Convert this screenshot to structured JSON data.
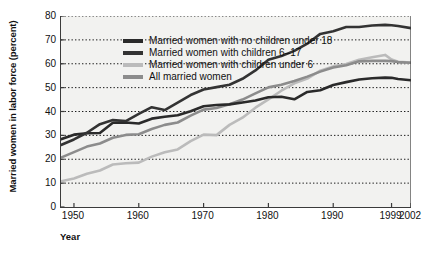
{
  "chart_data": {
    "type": "line",
    "title": "",
    "xlabel": "Year",
    "ylabel": "Married women in labor force (percent)",
    "xlim": [
      1948,
      2002
    ],
    "ylim": [
      0,
      80
    ],
    "xticks": [
      "1950",
      "1960",
      "1970",
      "1980",
      "1990",
      "1999",
      "2002"
    ],
    "xtick_values": [
      1950,
      1960,
      1970,
      1980,
      1990,
      1999,
      2002
    ],
    "yticks": [
      "0",
      "10",
      "20",
      "30",
      "40",
      "50",
      "60",
      "70",
      "80"
    ],
    "ytick_values": [
      0,
      10,
      20,
      30,
      40,
      50,
      60,
      70,
      80
    ],
    "grid": "horizontal-dotted",
    "legend_position": "upper-left-inside",
    "series": [
      {
        "name": "Married women with no children under 18",
        "color": "#2a2a2a",
        "x": [
          1948,
          1950,
          1952,
          1954,
          1956,
          1958,
          1960,
          1962,
          1964,
          1966,
          1968,
          1970,
          1972,
          1974,
          1976,
          1978,
          1980,
          1982,
          1984,
          1986,
          1988,
          1990,
          1992,
          1994,
          1996,
          1998,
          1999,
          2000,
          2002
        ],
        "values": [
          28.4,
          30.3,
          30.9,
          31.0,
          35.3,
          35.4,
          35.0,
          37.0,
          37.8,
          38.4,
          40.1,
          42.2,
          42.7,
          43.0,
          43.8,
          44.6,
          46.0,
          46.2,
          45.1,
          48.2,
          48.9,
          51.1,
          52.3,
          53.4,
          53.9,
          54.2,
          54.1,
          53.6,
          53.1
        ]
      },
      {
        "name": "Married women with children 6–17",
        "color": "#333333",
        "x": [
          1948,
          1950,
          1952,
          1954,
          1956,
          1958,
          1960,
          1962,
          1964,
          1966,
          1968,
          1970,
          1972,
          1974,
          1976,
          1978,
          1980,
          1982,
          1984,
          1986,
          1988,
          1990,
          1992,
          1994,
          1996,
          1998,
          1999,
          2000,
          2002
        ],
        "values": [
          26.0,
          28.3,
          31.1,
          34.7,
          36.4,
          36.0,
          39.0,
          41.8,
          40.6,
          43.7,
          46.9,
          49.2,
          50.2,
          51.2,
          53.7,
          57.2,
          61.7,
          63.2,
          65.4,
          68.4,
          72.5,
          73.6,
          75.4,
          75.4,
          76.0,
          76.3,
          76.1,
          75.8,
          74.9
        ]
      },
      {
        "name": "Married women with children under 6",
        "color": "#bbbbbb",
        "x": [
          1948,
          1950,
          1952,
          1954,
          1956,
          1958,
          1960,
          1962,
          1964,
          1966,
          1968,
          1970,
          1972,
          1974,
          1976,
          1978,
          1980,
          1982,
          1984,
          1986,
          1988,
          1990,
          1992,
          1994,
          1996,
          1998,
          1999,
          2000,
          2002
        ],
        "values": [
          10.8,
          11.9,
          13.9,
          15.3,
          17.8,
          18.3,
          18.6,
          21.1,
          22.9,
          24.1,
          27.6,
          30.3,
          30.1,
          34.4,
          37.4,
          41.6,
          45.1,
          48.7,
          51.8,
          53.8,
          57.1,
          58.9,
          59.9,
          61.7,
          62.7,
          63.7,
          61.8,
          60.8,
          60.5
        ]
      },
      {
        "name": "All married women",
        "color": "#8c8c8c",
        "x": [
          1948,
          1950,
          1952,
          1954,
          1956,
          1958,
          1960,
          1962,
          1964,
          1966,
          1968,
          1970,
          1972,
          1974,
          1976,
          1978,
          1980,
          1982,
          1984,
          1986,
          1988,
          1990,
          1992,
          1994,
          1996,
          1998,
          1999,
          2000,
          2002
        ],
        "values": [
          20.7,
          23.0,
          25.3,
          26.6,
          29.0,
          30.2,
          30.5,
          32.7,
          34.4,
          35.4,
          38.3,
          40.8,
          41.5,
          43.0,
          45.0,
          47.6,
          50.1,
          51.2,
          52.8,
          54.6,
          56.7,
          58.4,
          59.4,
          61.0,
          61.2,
          61.2,
          61.1,
          60.7,
          60.4
        ]
      }
    ],
    "legend": [
      {
        "label": "Married women with no children under 18",
        "swatch_color": "#2a2a2a",
        "icon": "line-swatch-icon"
      },
      {
        "label": "Married women with children 6–17",
        "swatch_color": "#333333",
        "icon": "line-swatch-icon"
      },
      {
        "label": "Married women with children under 6",
        "swatch_color": "#bbbbbb",
        "icon": "line-swatch-icon"
      },
      {
        "label": "All married women",
        "swatch_color": "#8c8c8c",
        "icon": "line-swatch-icon"
      }
    ],
    "style": {
      "plot_background": "#f2f2f0",
      "axis_color": "#3b3b3b",
      "gridline_color": "#1a1a1a",
      "page_background": "#ffffff"
    }
  }
}
